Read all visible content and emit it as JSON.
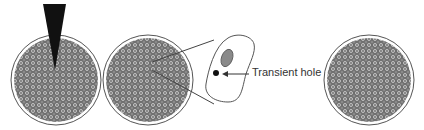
{
  "figure": {
    "panels": [
      {
        "id": "embryo-injection",
        "description": "Cell mass (embryo) being pierced by a micro-needle"
      },
      {
        "id": "embryo-after-injection",
        "description": "Cell mass with zoom-in lines to a single cell"
      },
      {
        "id": "embryo-recovered",
        "description": "Cell mass after recovery"
      }
    ],
    "inset": {
      "description": "Single cell with nucleus and transient hole"
    },
    "annotations": [
      {
        "text": "Transient hole",
        "points_to": "hole-dot"
      }
    ],
    "colors": {
      "cell_fill": "#9a9a9a",
      "cell_outline": "#555555",
      "needle": "#111111",
      "nucleus": "#8a8a8a",
      "line": "#444444"
    }
  }
}
